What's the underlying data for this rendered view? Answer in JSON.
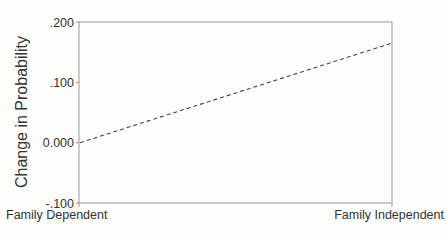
{
  "chart_data": {
    "type": "line",
    "title": "",
    "xlabel": "",
    "ylabel": "Change in Probability",
    "categories": [
      "Family Dependent",
      "Family Independent"
    ],
    "series": [
      {
        "name": "Change in Probability",
        "style": "dashed",
        "values": [
          0.0,
          0.165
        ]
      }
    ],
    "ylim": [
      -0.1,
      0.2
    ],
    "yticks": [
      ".200",
      ".100",
      "0.000",
      "-.100"
    ],
    "ytick_values": [
      0.2,
      0.1,
      0.0,
      -0.1
    ],
    "grid": false,
    "legend": null,
    "colors": {
      "line": "#444444",
      "frame": "#888888",
      "background": "#fdfdf9"
    }
  }
}
